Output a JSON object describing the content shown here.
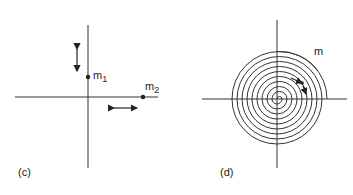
{
  "panels": [
    {
      "id": "c",
      "caption": "(c)",
      "masses": [
        {
          "label": "m",
          "subscript": "1"
        },
        {
          "label": "m",
          "subscript": "2"
        }
      ]
    },
    {
      "id": "d",
      "caption": "(d)",
      "mass_label": "m"
    }
  ],
  "colors": {
    "ink": "#222222",
    "background": "#ffffff"
  }
}
